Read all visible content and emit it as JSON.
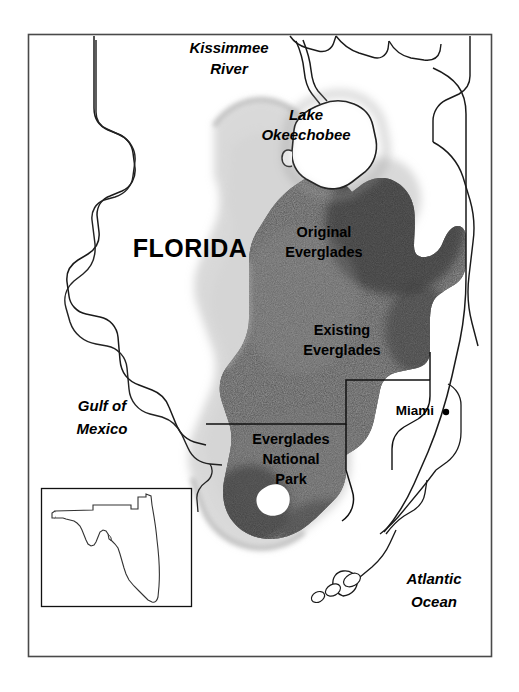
{
  "figure": {
    "type": "thematic-map",
    "border_color": "#4a4a4a",
    "background_color": "#ffffff"
  },
  "labels": {
    "state": "FLORIDA",
    "river": "Kissimmee\nRiver",
    "river_line1": "Kissimmee",
    "river_line2": "River",
    "lake_line1": "Lake",
    "lake_line2": "Okeechobee",
    "original_line1": "Original",
    "original_line2": "Everglades",
    "existing_line1": "Existing",
    "existing_line2": "Everglades",
    "park_line1": "Everglades",
    "park_line2": "National",
    "park_line3": "Park",
    "city_miami": "Miami",
    "gulf_line1": "Gulf of",
    "gulf_line2": "Mexico",
    "atlantic_line1": "Atlantic",
    "atlantic_line2": "Ocean"
  },
  "regions": [
    {
      "name": "Original Everglades",
      "fill": "soft-gray-airbrush",
      "color": "#b9b9b9"
    },
    {
      "name": "Existing Everglades",
      "fill": "dark-stipple",
      "color": "#4e4e4e"
    },
    {
      "name": "Everglades National Park",
      "fill": "dark-stipple-with-outline",
      "color": "#585858"
    }
  ],
  "inset": {
    "name": "Florida state locator inset",
    "border_color": "#000000",
    "outline_color": "#333333"
  },
  "water_bodies": [
    "Lake Okeechobee",
    "Gulf of Mexico",
    "Atlantic Ocean"
  ],
  "features": [
    "Kissimmee River",
    "Florida Keys",
    "Miami"
  ]
}
